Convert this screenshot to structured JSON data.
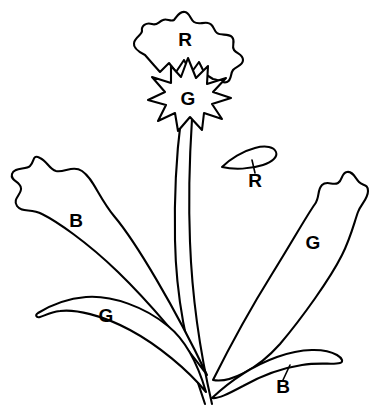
{
  "figure": {
    "background_color": "#ffffff",
    "stroke_color": "#000000",
    "width": 371,
    "height": 411
  },
  "labels": [
    {
      "id": "corolla-upper",
      "text": "R",
      "x": 185,
      "y": 41,
      "part": "outer-corolla",
      "has_leader": false
    },
    {
      "id": "star-center",
      "text": "G",
      "x": 188,
      "y": 100,
      "part": "inner-star-calyx",
      "has_leader": false
    },
    {
      "id": "detached-petal",
      "text": "R",
      "x": 255,
      "y": 182,
      "part": "detached-petal",
      "has_leader": true
    },
    {
      "id": "leaf-left-upper",
      "text": "B",
      "x": 76,
      "y": 222,
      "part": "basal-leaf-left-upper",
      "has_leader": false
    },
    {
      "id": "leaf-right-upper",
      "text": "G",
      "x": 313,
      "y": 244,
      "part": "leaf-right-upper",
      "has_leader": false
    },
    {
      "id": "leaf-left-lower",
      "text": "G",
      "x": 106,
      "y": 317,
      "part": "leaf-left-lower",
      "has_leader": false
    },
    {
      "id": "leaf-right-lower",
      "text": "B",
      "x": 283,
      "y": 388,
      "part": "basal-leaf-right-lower",
      "has_leader": true
    }
  ],
  "shapes": {
    "corolla_outline": "M 145 55 C 139 52 133 48 134 43 C 135 37 142 35 142 31 C 141 26 146 22 152 24 C 157 26 158 22 163 20 C 167 18 170 22 174 20 C 177 17 179 11 185 12 C 190 13 190 19 194 22 C 198 25 203 22 208 23 C 214 24 213 30 217 33 C 221 36 228 33 232 37 C 236 41 231 46 234 50 C 237 54 243 54 243 60 C 243 66 236 66 233 70 C 230 74 232 80 227 82 C 222 84 218 79 213 79 L 205 74 L 199 62 L 191 73 L 184 60 L 176 72 L 169 63 L 160 72 L 152 63 Z",
    "star_outline": "M 188 58 L 196 78 L 208 66 L 207 84 L 226 78 L 213 92 L 231 98 L 212 104 L 222 119 L 204 113 L 202 130 L 190 117 L 178 131 L 175 113 L 158 121 L 166 105 L 148 100 L 165 92 L 152 77 L 171 83 L 171 66 L 181 77 Z",
    "stem_left": "M 181 119 C 177 150 174 190 175 240 C 176 295 186 350 205 404",
    "stem_right": "M 192 119 C 190 150 188 192 190 242 C 192 296 200 352 212 404",
    "leaf_left_upper": "M 207 375 C 185 345 150 303 118 272 C 86 241 56 221 42 214 C 31 208 22 213 17 206 C 12 199 22 194 21 188 C 20 181 10 181 12 174 C 14 167 26 170 30 166 C 35 161 32 154 40 158 C 47 161 49 169 56 171 C 64 173 73 165 82 171 C 93 178 99 198 114 216 C 136 242 175 308 207 375 Z",
    "leaf_left_lower": "M 206 392 C 188 370 158 345 130 330 C 102 315 75 309 60 311 C 50 312 44 316 40 317 C 36 318 35 315 38 313 C 46 308 63 299 86 297 C 112 295 145 307 168 326 C 188 342 199 368 206 392 Z",
    "leaf_right_upper": "M 213 380 C 229 348 252 306 272 274 C 292 242 307 215 315 204 C 320 197 317 190 322 185 C 327 180 333 186 338 183 C 343 180 341 173 347 172 C 353 171 355 178 359 182 C 363 186 368 184 368 191 C 368 199 361 204 358 212 C 354 223 351 237 342 255 C 330 279 302 318 280 344 C 256 371 229 383 213 380 Z",
    "leaf_right_lower": "M 212 398 C 228 383 252 366 277 357 C 302 348 325 348 337 355 C 342 358 344 362 340 363 C 333 365 320 362 302 365 C 282 368 259 377 243 386 C 228 394 218 399 212 398 Z",
    "detached_petal": "M 222 167 C 230 159 243 151 255 148 C 266 145 274 147 276 152 C 278 157 272 162 263 165 C 251 169 234 170 222 167 Z",
    "leader_detached_petal": "M 252 160 L 255 173",
    "leader_leaf_right_lower": "M 290 365 L 283 380"
  }
}
